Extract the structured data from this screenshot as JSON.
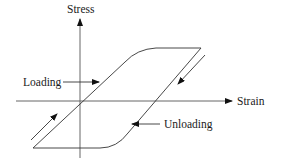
{
  "diagram": {
    "type": "stress-strain hysteresis loop",
    "axes": {
      "y_label": "Stress",
      "x_label": "Strain"
    },
    "annotations": {
      "loading_label": "Loading",
      "unloading_label": "Unloading"
    },
    "colors": {
      "line": "#333333",
      "axis": "#555555",
      "text": "#1a1a1a",
      "background": "#ffffff"
    }
  }
}
